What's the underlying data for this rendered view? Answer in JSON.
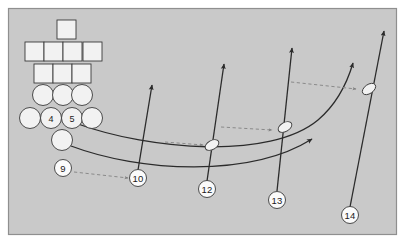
{
  "diagram": {
    "canvas": {
      "width": 405,
      "height": 243
    },
    "colors": {
      "page_background": "#ffffff",
      "field_background": "#c9c9c9",
      "field_border": "#8f8f8f",
      "shape_fill": "#f2f2f2",
      "shape_stroke": "#3a3a3a",
      "route_stroke": "#2b2b2b",
      "motion_stroke": "#8a8a8a",
      "label_text": "#1a1a1a"
    },
    "field": {
      "x": 8,
      "y": 8,
      "width": 389,
      "height": 227
    }
  },
  "formation": {
    "squares": [
      {
        "id": "square-top",
        "x": 57,
        "y": 20,
        "size": 19
      },
      {
        "id": "square-row2-1",
        "x": 25,
        "y": 42,
        "size": 19
      },
      {
        "id": "square-row2-2",
        "x": 44,
        "y": 42,
        "size": 19
      },
      {
        "id": "square-row2-3",
        "x": 63,
        "y": 42,
        "size": 19
      },
      {
        "id": "square-row2-4",
        "x": 83,
        "y": 42,
        "size": 19
      },
      {
        "id": "square-row3-1",
        "x": 34,
        "y": 64,
        "size": 19
      },
      {
        "id": "square-row3-2",
        "x": 53,
        "y": 64,
        "size": 19
      },
      {
        "id": "square-row3-3",
        "x": 72,
        "y": 64,
        "size": 19
      }
    ],
    "circles": [
      {
        "id": "circle-row1-1",
        "cx": 43,
        "cy": 95,
        "r": 10.5,
        "label": ""
      },
      {
        "id": "circle-row1-2",
        "cx": 63,
        "cy": 95,
        "r": 10.5,
        "label": ""
      },
      {
        "id": "circle-row1-3",
        "cx": 82,
        "cy": 95,
        "r": 10.5,
        "label": ""
      },
      {
        "id": "circle-row2-1",
        "cx": 30,
        "cy": 118,
        "r": 10.5,
        "label": ""
      },
      {
        "id": "circle-player-4",
        "cx": 51,
        "cy": 118,
        "r": 10.5,
        "label": "4"
      },
      {
        "id": "circle-player-5",
        "cx": 72,
        "cy": 118,
        "r": 10.5,
        "label": "5"
      },
      {
        "id": "circle-row2-4",
        "cx": 92,
        "cy": 118,
        "r": 10.5,
        "label": ""
      },
      {
        "id": "circle-backfield",
        "cx": 62,
        "cy": 140,
        "r": 10.5,
        "label": ""
      }
    ]
  },
  "markers": [
    {
      "id": "marker-9",
      "label": "9",
      "cx": 63,
      "cy": 168,
      "r": 8.5
    },
    {
      "id": "marker-10",
      "label": "10",
      "cx": 138,
      "cy": 178,
      "r": 8.5
    },
    {
      "id": "marker-12",
      "label": "12",
      "cx": 207,
      "cy": 189,
      "r": 8.5
    },
    {
      "id": "marker-13",
      "label": "13",
      "cx": 277,
      "cy": 200,
      "r": 8.5
    },
    {
      "id": "marker-14",
      "label": "14",
      "cx": 350,
      "cy": 215,
      "r": 8.5
    }
  ],
  "routes": {
    "straight": [
      {
        "id": "route-10",
        "from_marker": "10",
        "path": "M 138 170 L 152 85",
        "arrow_at": {
          "x": 152,
          "y": 85
        },
        "angle_deg": -81
      },
      {
        "id": "route-12",
        "from_marker": "12",
        "path": "M 207 181 L 224 64",
        "arrow_at": {
          "x": 224,
          "y": 64
        },
        "angle_deg": -82
      },
      {
        "id": "route-13",
        "from_marker": "13",
        "path": "M 277 191 L 292 48",
        "arrow_at": {
          "x": 292,
          "y": 48
        },
        "angle_deg": -84
      },
      {
        "id": "route-14",
        "from_marker": "14",
        "path": "M 350 207 L 384 31",
        "arrow_at": {
          "x": 384,
          "y": 31
        },
        "angle_deg": -79
      }
    ],
    "curved": [
      {
        "id": "route-curve-upper",
        "from": "circle-player-5",
        "path": "M 78 124 C 150 150, 270 160, 318 120 C 338 103, 348 80, 353 63",
        "arrow_at": {
          "x": 353,
          "y": 63
        },
        "angle_deg": -74
      },
      {
        "id": "route-curve-lower",
        "from": "circle-backfield",
        "path": "M 71 146 C 140 172, 250 178, 312 139",
        "arrow_at": {
          "x": 312,
          "y": 139
        },
        "angle_deg": -33
      }
    ],
    "motion_dashed": [
      {
        "id": "motion-9-to-10",
        "path": "M 74 172 L 128 178",
        "arrow_at": {
          "x": 130,
          "y": 178
        },
        "angle_deg": 6
      },
      {
        "id": "motion-to-ball-12",
        "path": "M 165 142 L 203 145",
        "arrow_at": {
          "x": 205,
          "y": 145
        },
        "angle_deg": 5
      },
      {
        "id": "motion-to-ball-13",
        "path": "M 221 127 L 272 130",
        "arrow_at": {
          "x": 274,
          "y": 130
        },
        "angle_deg": 4
      },
      {
        "id": "motion-to-ball-14",
        "path": "M 291 82 L 356 89",
        "arrow_at": {
          "x": 358,
          "y": 89
        },
        "angle_deg": 7
      }
    ]
  },
  "balls": [
    {
      "id": "ball-on-route-12",
      "cx": 212,
      "cy": 145,
      "rx": 7.5,
      "ry": 4.5,
      "rotation_deg": -30
    },
    {
      "id": "ball-on-route-13",
      "cx": 285,
      "cy": 127,
      "rx": 7.5,
      "ry": 4.5,
      "rotation_deg": -30
    },
    {
      "id": "ball-on-route-14",
      "cx": 369,
      "cy": 89,
      "rx": 7.5,
      "ry": 4.5,
      "rotation_deg": -35
    }
  ]
}
